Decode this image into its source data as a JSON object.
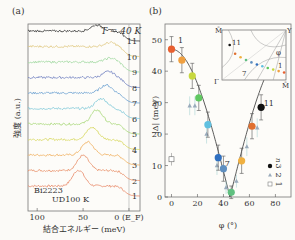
{
  "chart_data": [
    {
      "type": "line",
      "panel_label": "(a)",
      "title": "",
      "annotation_temperature": "T = 40 K",
      "sample_label_1": "Bi2223",
      "sample_label_2": "UD100 K",
      "xlabel": "結合エネルギー (meV)",
      "ylabel": "強度 (a.u.)",
      "x_ticks": [
        "100",
        "50",
        "0 (E_F)"
      ],
      "x_tick_values": [
        100,
        50,
        0
      ],
      "xlim": [
        110,
        -12
      ],
      "reference_line_x": 0,
      "curve_labels": [
        "1",
        "2",
        "3",
        "4",
        "5",
        "6",
        "7",
        "8",
        "9",
        "10",
        "11"
      ],
      "series": [
        {
          "name": "1",
          "color": "#e88a6a",
          "peak_meV": 55,
          "peak_height": 1.6
        },
        {
          "name": "2",
          "color": "#e9906a",
          "peak_meV": 50,
          "peak_height": 1.5
        },
        {
          "name": "3",
          "color": "#f0b060",
          "peak_meV": 45,
          "peak_height": 1.3
        },
        {
          "name": "4",
          "color": "#d8d860",
          "peak_meV": 40,
          "peak_height": 1.2
        },
        {
          "name": "5",
          "color": "#a8d878",
          "peak_meV": 35,
          "peak_height": 1.4
        },
        {
          "name": "6",
          "color": "#7ec8d8",
          "peak_meV": 30,
          "peak_height": 1.0
        },
        {
          "name": "7",
          "color": "#6aa0d0",
          "peak_meV": 25,
          "peak_height": 0.8
        },
        {
          "name": "8",
          "color": "#7080c0",
          "peak_meV": 22,
          "peak_height": 0.6
        },
        {
          "name": "9",
          "color": "#a0d8a0",
          "peak_meV": 20,
          "peak_height": 0.4
        },
        {
          "name": "10",
          "color": "#e0c880",
          "peak_meV": 20,
          "peak_height": 0.4
        },
        {
          "name": "11",
          "color": "#333333",
          "peak_meV": 35,
          "peak_height": 0.6
        }
      ]
    },
    {
      "type": "scatter",
      "panel_label": "(b)",
      "title": "",
      "xlabel": "φ (°)",
      "ylabel": "|Δ| (meV)",
      "xlim": [
        -5,
        92
      ],
      "ylim": [
        0,
        55
      ],
      "x_ticks": [
        0,
        20,
        40,
        60,
        80
      ],
      "y_ticks": [
        0,
        10,
        20,
        30,
        40,
        50
      ],
      "legend_title": "n",
      "legend": [
        {
          "label": "3",
          "marker": "filled-circle"
        },
        {
          "label": "2",
          "marker": "triangle"
        },
        {
          "label": "1",
          "marker": "open-square"
        }
      ],
      "legend_position": "bottom-right",
      "point_annotations": [
        {
          "text": "1",
          "x": 5,
          "y": 49
        },
        {
          "text": "7",
          "x": 41,
          "y": 10
        },
        {
          "text": "11",
          "x": 71,
          "y": 29
        }
      ],
      "series": [
        {
          "name": "n=3",
          "points": [
            {
              "x": 0,
              "y": 47,
              "err": 4,
              "color": "#e86030"
            },
            {
              "x": 8,
              "y": 43.5,
              "err": 4,
              "color": "#f0a040"
            },
            {
              "x": 16,
              "y": 38.5,
              "err": 4,
              "color": "#c8d840"
            },
            {
              "x": 21,
              "y": 31.5,
              "err": 4,
              "color": "#60c860"
            },
            {
              "x": 28,
              "y": 23,
              "err": 4,
              "color": "#60c0e0"
            },
            {
              "x": 36,
              "y": 12.5,
              "err": 4,
              "color": "#3070c0"
            },
            {
              "x": 40,
              "y": 9,
              "err": 4,
              "color": "#6090c0"
            },
            {
              "x": 46,
              "y": 1.5,
              "err": 2,
              "color": "#60c080"
            },
            {
              "x": 54,
              "y": 11.5,
              "err": 4,
              "color": "#f0b040"
            },
            {
              "x": 62,
              "y": 22.5,
              "err": 4,
              "color": "#e07030"
            },
            {
              "x": 69,
              "y": 28.5,
              "err": 4,
              "color": "#111111"
            }
          ]
        },
        {
          "name": "n=2",
          "points": [
            {
              "x": 14,
              "y": 29,
              "err": 3
            },
            {
              "x": 18,
              "y": 29,
              "err": 3
            },
            {
              "x": 27,
              "y": 20,
              "err": 3
            },
            {
              "x": 35,
              "y": 10,
              "err": 3
            },
            {
              "x": 42,
              "y": 3,
              "err": 2
            },
            {
              "x": 50,
              "y": 5,
              "err": 2
            },
            {
              "x": 58,
              "y": 16,
              "err": 3
            },
            {
              "x": 66,
              "y": 22,
              "err": 3
            }
          ]
        },
        {
          "name": "n=1",
          "points": [
            {
              "x": 0,
              "y": 12,
              "err": 2
            }
          ]
        }
      ],
      "fit_curve": "d-wave |cos kx - cos ky| fit, minimum at 45°",
      "inset": {
        "corner_labels": [
          "M̄",
          "Y",
          "Γ",
          "M̄"
        ],
        "angle_label": "φ",
        "point_labels": [
          "11",
          "7",
          "1"
        ],
        "point_colors": [
          "#111111",
          "#e07030",
          "#f0b040",
          "#60c080",
          "#6090c0",
          "#3070c0",
          "#60c0e0",
          "#60c860",
          "#c8d840",
          "#f0a040",
          "#e86030"
        ]
      }
    }
  ]
}
